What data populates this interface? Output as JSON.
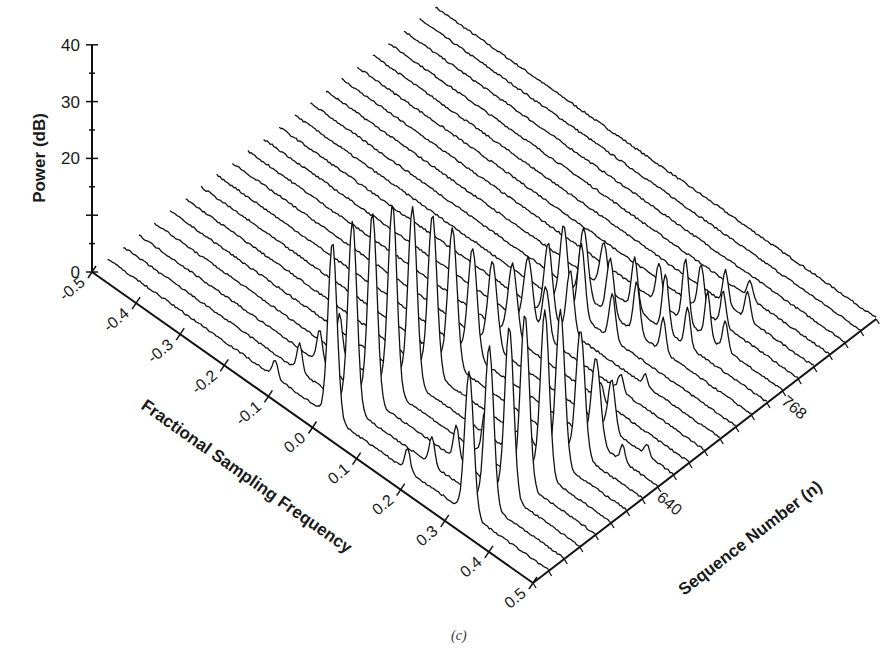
{
  "chart_data": {
    "type": "waterfall-3d",
    "title": "",
    "caption": "(c)",
    "zlabel": "Power (dB)",
    "xlabel": "Fractional Sampling Frequency",
    "ylabel": "Sequence Number (n)",
    "z_ticks": [
      0,
      10,
      20,
      30,
      40
    ],
    "z_tick_labels": [
      "0",
      "20",
      "30",
      "40"
    ],
    "z_labeled_ticks": [
      0,
      20,
      30,
      40
    ],
    "zlim": [
      0,
      40
    ],
    "x_ticks": [
      -0.5,
      -0.4,
      -0.3,
      -0.2,
      -0.1,
      0.0,
      0.1,
      0.2,
      0.3,
      0.4,
      0.5
    ],
    "x_tick_labels": [
      "-0.5",
      "-0.4",
      "-0.3",
      "-0.2",
      "-0.1",
      "0.0",
      "0.1",
      "0.2",
      "0.3",
      "0.4",
      "0.5"
    ],
    "xlim": [
      -0.5,
      0.5
    ],
    "y_tick_labels": [
      {
        "value": 640,
        "label": "640"
      },
      {
        "value": 768,
        "label": "768"
      }
    ],
    "ylim": [
      512,
      864
    ],
    "n_step": 16,
    "traces": [
      {
        "n": 528,
        "peaks": [
          [
            -0.12,
            3,
            0.006
          ],
          [
            0.01,
            31,
            0.01
          ],
          [
            0.32,
            25,
            0.01
          ],
          [
            0.18,
            4,
            0.006
          ]
        ]
      },
      {
        "n": 544,
        "peaks": [
          [
            -0.1,
            5,
            0.006
          ],
          [
            0.02,
            33,
            0.01
          ],
          [
            0.33,
            28,
            0.01
          ],
          [
            0.2,
            5,
            0.006
          ]
        ]
      },
      {
        "n": 560,
        "peaks": [
          [
            -0.09,
            6,
            0.006
          ],
          [
            0.03,
            33,
            0.01
          ],
          [
            0.34,
            30,
            0.01
          ],
          [
            0.22,
            6,
            0.006
          ]
        ]
      },
      {
        "n": 576,
        "peaks": [
          [
            -0.08,
            7,
            0.006
          ],
          [
            0.04,
            33,
            0.01
          ],
          [
            0.34,
            30,
            0.01
          ],
          [
            0.25,
            8,
            0.007
          ]
        ]
      },
      {
        "n": 592,
        "peaks": [
          [
            0.05,
            31,
            0.01
          ],
          [
            0.35,
            29,
            0.01
          ],
          [
            0.27,
            9,
            0.007
          ]
        ]
      },
      {
        "n": 608,
        "peaks": [
          [
            0.06,
            28,
            0.01
          ],
          [
            0.35,
            27,
            0.01
          ],
          [
            0.27,
            8,
            0.007
          ]
        ]
      },
      {
        "n": 624,
        "peaks": [
          [
            0.07,
            24,
            0.01
          ],
          [
            0.36,
            22,
            0.01
          ]
        ]
      },
      {
        "n": 640,
        "peaks": [
          [
            0.08,
            19,
            0.01
          ],
          [
            0.36,
            15,
            0.01
          ],
          [
            0.42,
            3,
            0.005
          ]
        ]
      },
      {
        "n": 656,
        "peaks": [
          [
            0.09,
            15,
            0.01
          ],
          [
            0.36,
            9,
            0.008
          ],
          [
            0.44,
            2,
            0.005
          ]
        ]
      },
      {
        "n": 672,
        "peaks": [
          [
            0.1,
            13,
            0.01
          ],
          [
            0.3,
            3,
            0.006
          ]
        ]
      },
      {
        "n": 688,
        "peaks": [
          [
            0.1,
            12,
            0.01
          ],
          [
            0.14,
            9,
            0.008
          ],
          [
            0.31,
            3,
            0.006
          ]
        ]
      },
      {
        "n": 704,
        "peaks": [
          [
            0.11,
            13,
            0.009
          ],
          [
            0.16,
            11,
            0.008
          ],
          [
            0.33,
            2,
            0.005
          ]
        ]
      },
      {
        "n": 720,
        "peaks": [
          [
            0.11,
            14,
            0.009
          ],
          [
            0.15,
            13,
            0.008
          ],
          [
            0.22,
            8,
            0.007
          ]
        ]
      },
      {
        "n": 736,
        "peaks": [
          [
            0.12,
            12,
            0.009
          ],
          [
            0.18,
            10,
            0.008
          ],
          [
            0.24,
            9,
            0.007
          ],
          [
            0.3,
            6,
            0.006
          ]
        ]
      },
      {
        "n": 752,
        "peaks": [
          [
            0.13,
            8,
            0.008
          ],
          [
            0.2,
            9,
            0.007
          ],
          [
            0.27,
            10,
            0.007
          ],
          [
            0.32,
            7,
            0.006
          ]
        ]
      },
      {
        "n": 768,
        "peaks": [
          [
            0.22,
            7,
            0.007
          ],
          [
            0.28,
            11,
            0.007
          ],
          [
            0.33,
            8,
            0.006
          ],
          [
            0.37,
            5,
            0.006
          ]
        ]
      },
      {
        "n": 784,
        "peaks": [
          [
            0.28,
            8,
            0.007
          ],
          [
            0.33,
            6,
            0.006
          ]
        ]
      },
      {
        "n": 800,
        "peaks": [
          [
            0.3,
            6,
            0.006
          ],
          [
            0.35,
            5,
            0.006
          ]
        ]
      },
      {
        "n": 816,
        "peaks": [
          [
            0.32,
            3,
            0.006
          ]
        ]
      },
      {
        "n": 832,
        "peaks": []
      },
      {
        "n": 848,
        "peaks": []
      },
      {
        "n": 864,
        "peaks": []
      }
    ],
    "grid": false,
    "legend": null
  },
  "geometry": {
    "origin": [
      92,
      272
    ],
    "freq_vec_per_unit": [
      441,
      311
    ],
    "seq_vec_per_step": [
      15.6,
      -12.0
    ],
    "px_per_db": 5.68,
    "num_steps": 22,
    "stroke": "#111111",
    "axis_stroke": "#111111"
  }
}
